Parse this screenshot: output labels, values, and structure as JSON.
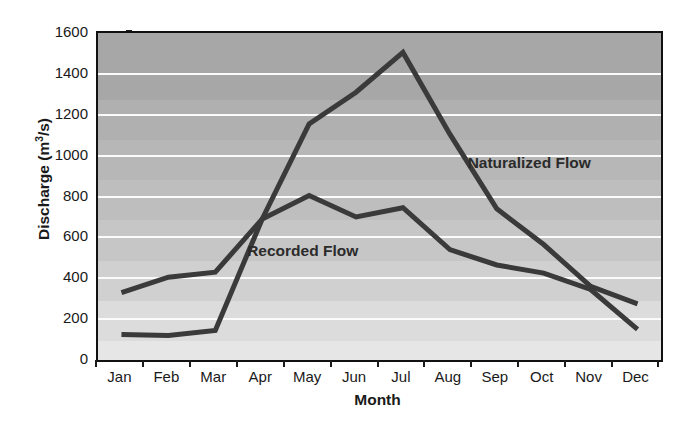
{
  "chart_data": {
    "type": "line",
    "title": "",
    "xlabel": "Month",
    "ylabel": "Discharge (m3/s)",
    "ylabel_base": "Discharge (m",
    "ylabel_sup": "3",
    "ylabel_tail": "/s)",
    "categories": [
      "Jan",
      "Feb",
      "Mar",
      "Apr",
      "May",
      "Jun",
      "Jul",
      "Aug",
      "Sep",
      "Oct",
      "Nov",
      "Dec"
    ],
    "x": [
      1,
      2,
      3,
      4,
      5,
      6,
      7,
      8,
      9,
      10,
      11,
      12
    ],
    "ylim": [
      0,
      1600
    ],
    "xlim": [
      0.5,
      12.5
    ],
    "ytick_values": [
      0,
      200,
      400,
      600,
      800,
      1000,
      1200,
      1400,
      1600
    ],
    "ytick_labels": [
      "0",
      "200",
      "400",
      "600",
      "800",
      "1000",
      "1200",
      "1400",
      "1600"
    ],
    "grid": true,
    "grid_color": "#fbfbfb",
    "legend_position": "in-plot-annotation",
    "plot_bg_top": "#a7a7a7",
    "plot_bg_bottom": "#e6e6e6",
    "line_color": "#3a3a3a",
    "line_width": 5,
    "series": [
      {
        "name": "Naturalized Flow",
        "label_x": 11,
        "label_y": 960,
        "values": [
          125,
          120,
          145,
          690,
          1155,
          1310,
          1505,
          1105,
          740,
          565,
          360,
          275
        ]
      },
      {
        "name": "Recorded Flow",
        "label_x": 5,
        "label_y": 530,
        "values": [
          330,
          405,
          430,
          690,
          805,
          700,
          745,
          540,
          465,
          425,
          345,
          150
        ]
      }
    ],
    "annotations": [
      {
        "text": "Naturalized Flow",
        "name": "naturalized-flow-label"
      },
      {
        "text": "Recorded Flow",
        "name": "recorded-flow-label"
      }
    ]
  }
}
